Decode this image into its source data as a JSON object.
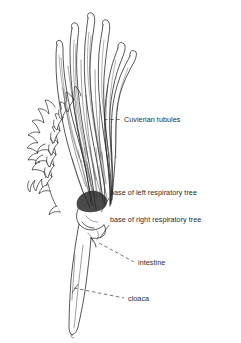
{
  "figure": {
    "background_color": "#ffffff",
    "ink_color": "#1d1d1d",
    "label_color": "#2b2b2b"
  },
  "labels": [
    {
      "id": "cuvierian-tubules",
      "text": "Cuvierian tubules",
      "x": 124,
      "y": 122,
      "leader": {
        "type": "dashed",
        "x1": 104,
        "y1": 119.5,
        "x2": 121,
        "y2": 119.5
      }
    },
    {
      "id": "base-left-respiratory-tree",
      "text": "base of left respiratory tree",
      "x": 110,
      "y": 195,
      "leader": {
        "type": "solid",
        "x1": 109,
        "y1": 198,
        "x2": 101,
        "y2": 212
      }
    },
    {
      "id": "base-right-respiratory-tree",
      "text": "base of right respiratory tree",
      "x": 110,
      "y": 222,
      "leader": {
        "type": "solid",
        "x1": 109,
        "y1": 225,
        "x2": 100,
        "y2": 238
      }
    },
    {
      "id": "intestine",
      "text": "intestine",
      "x": 138,
      "y": 265,
      "leader": {
        "type": "dashed",
        "x1": 99,
        "y1": 243,
        "x2": 134,
        "y2": 262
      }
    },
    {
      "id": "cloaca",
      "text": "cloaca",
      "x": 128,
      "y": 301,
      "leader": {
        "type": "dashed",
        "x1": 74,
        "y1": 288,
        "x2": 124,
        "y2": 298
      }
    }
  ],
  "structures": [
    {
      "id": "cuvierian-tubules-bundle",
      "name": "Cuvierian tubules",
      "description": "bundle of long finger-like tubules rising from the base"
    },
    {
      "id": "left-respiratory-tree",
      "name": "left respiratory tree",
      "description": "branching lobed outline structure on the left"
    },
    {
      "id": "intestine-region",
      "name": "intestine",
      "description": "short coiled segment below the tubule base"
    },
    {
      "id": "cloaca-tube",
      "name": "cloaca",
      "description": "elongated tapering tube descending to a pointed tip"
    }
  ]
}
